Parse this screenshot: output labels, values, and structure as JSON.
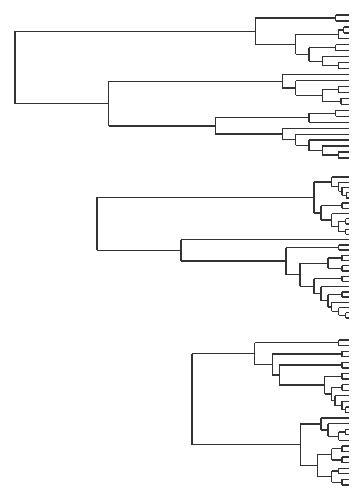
{
  "figure": {
    "line_color": "#333333",
    "background": "#ffffff"
  },
  "dendrograms": [
    {
      "name": "dendrogram-1",
      "root_height": 1.0,
      "tree": [
        0.25,
        [
          0.07,
          [
            0.01,
            "a",
            "b"
          ],
          [
            0.04,
            [
              0.008,
              [
                "c",
                "d"
              ],
              "e"
            ],
            [
              0.03,
              [
                0.01,
                "f",
                "g"
              ],
              [
                0.02,
                "h",
                [
                  0.008,
                  "i",
                  "j"
                ]
              ]
            ]
          ]
        ],
        [
          0.18,
          [
            0.05,
            "k",
            [
              0.04,
              "l",
              [
                0.02,
                [
                  0.008,
                  "m",
                  "n"
                ],
                [
                  0.006,
                  "o",
                  "p"
                ]
              ]
            ]
          ],
          [
            0.1,
            [
              0.03,
              [
                0.01,
                "q",
                "r"
              ],
              "s"
            ],
            [
              0.05,
              "t",
              [
                0.04,
                "u",
                [
                  0.03,
                  "v",
                  [
                    0.02,
                    "w",
                    [
                      0.008,
                      "x",
                      "y"
                    ]
                  ]
                ]
              ]
            ]
          ]
        ]
      ]
    },
    {
      "name": "dendrogram-2",
      "root_height": 0.72,
      "tree": [
        0.72,
        [
          0.1,
          [
            0.05,
            "a",
            [
              0.03,
              "b",
              [
                0.02,
                "c",
                [
                  0.008,
                  "d",
                  "e"
                ]
              ]
            ]
          ],
          [
            0.08,
            [
              0.02,
              "f",
              "g"
            ],
            [
              0.05,
              "h",
              [
                0.03,
                [
                  0.01,
                  "i",
                  "j"
                ],
                [
                  0.01,
                  "k",
                  "l"
                ]
              ]
            ]
          ]
        ],
        [
          0.48,
          "m",
          [
            0.18,
            [
              0.03,
              "n",
              "o"
            ],
            [
              0.14,
              [
                0.06,
                [
                  0.02,
                  "p",
                  "q"
                ],
                [
                  0.02,
                  "r",
                  "s"
                ]
              ],
              [
                0.1,
                [
                  0.02,
                  "t",
                  "u"
                ],
                [
                  0.08,
                  "v",
                  [
                    0.06,
                    [
                      0.02,
                      "w",
                      "x"
                    ],
                    [
                      0.05,
                      "y",
                      [
                        0.03,
                        "z",
                        [
                          0.01,
                          "aa",
                          "ab"
                        ]
                      ]
                    ]
                  ]
                ]
              ]
            ]
          ]
        ]
      ]
    },
    {
      "name": "dendrogram-3",
      "root_height": 0.45,
      "tree": [
        0.45,
        [
          0.27,
          [
            0.03,
            "a",
            "b"
          ],
          [
            0.22,
            [
              0.02,
              "c",
              "d"
            ],
            [
              0.2,
              [
                0.02,
                "e",
                "f"
              ],
              [
                0.07,
                [
                  0.02,
                  "g",
                  "h"
                ],
                [
                  0.05,
                  [
                    0.02,
                    "i",
                    "j"
                  ],
                  [
                    0.04,
                    "k",
                    [
                      0.02,
                      "l",
                      [
                        0.01,
                        "m",
                        "n"
                      ]
                    ]
                  ]
                ]
              ]
            ]
          ]
        ],
        [
          0.14,
          [
            0.08,
            "o",
            [
              0.06,
              "p",
              [
                0.03,
                [
                  0.01,
                  "q",
                  "r"
                ],
                "s"
              ]
            ]
          ],
          [
            0.09,
            [
              0.05,
              [
                0.02,
                "t",
                "u"
              ],
              [
                0.02,
                "v",
                "w"
              ]
            ],
            [
              0.05,
              [
                0.03,
                "x",
                "y"
              ],
              [
                0.02,
                "z",
                "aa"
              ]
            ]
          ]
        ]
      ]
    }
  ]
}
